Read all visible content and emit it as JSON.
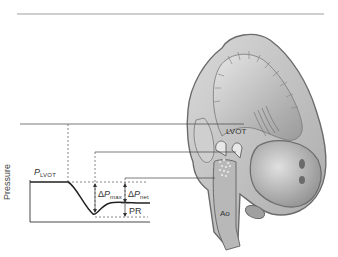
{
  "figure": {
    "type": "diagram",
    "anatomy_labels": {
      "lvot": "LVOT",
      "aorta": "Ao"
    },
    "graph": {
      "y_axis_label": "Pressure",
      "p_lvot": {
        "symbol": "P",
        "subscript": "LVOT"
      },
      "delta_p_max": {
        "prefix": "Δ",
        "symbol": "P",
        "subscript": "max"
      },
      "delta_p_net": {
        "prefix": "Δ",
        "symbol": "P",
        "subscript": "net"
      },
      "pressure_recovery": "PR"
    },
    "colors": {
      "line": "#333333",
      "dashed": "#555555",
      "heart_outline": "#6b6b6b",
      "heart_fill": "#c8c8c8",
      "top_rule": "#cfcfcf"
    }
  }
}
